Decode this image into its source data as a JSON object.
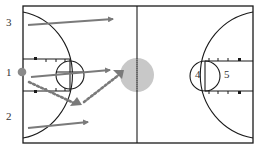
{
  "diagram": {
    "colors": {
      "court_line": "#1a1a1a",
      "arrow": "#7a7a7a",
      "pass_dotted": "#7a7a7a",
      "center_circle_fill": "#c8c8c8",
      "player_marker": "#8a8a8a",
      "label_text": "#333333"
    },
    "players": [
      {
        "id": "1",
        "label": "1",
        "x": 7,
        "y": 75
      },
      {
        "id": "2",
        "label": "2",
        "x": 7,
        "y": 118
      },
      {
        "id": "3",
        "label": "3",
        "x": 7,
        "y": 23
      },
      {
        "id": "4",
        "label": "4",
        "x": 195,
        "y": 76
      },
      {
        "id": "5",
        "label": "5",
        "x": 224,
        "y": 76
      }
    ],
    "movements": [
      {
        "type": "cut",
        "from": "3",
        "path": "arrow from (28,25) to (113,19)"
      },
      {
        "type": "cut",
        "from": "1",
        "path": "arrow from (30,76) to (110,70)"
      },
      {
        "type": "cut",
        "from": "2",
        "path": "arrow from (28,128) to (88,121)"
      },
      {
        "type": "pass",
        "from": "1",
        "path": "dotted from (28,80) to (76,105) to (123,72)"
      }
    ],
    "ball_position": {
      "label": "center circle",
      "x": 137,
      "y": 75
    }
  }
}
